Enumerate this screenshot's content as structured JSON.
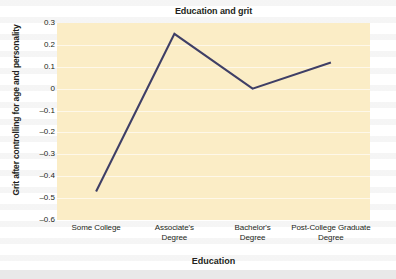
{
  "chart_data": {
    "type": "line",
    "title": "Education and grit",
    "xlabel": "Education",
    "ylabel": "Grit after controlling for age and personality",
    "categories": [
      "Some College",
      "Associate's\nDegree",
      "Bachelor's\nDegree",
      "Post-College Graduate\nDegree"
    ],
    "category_lines": [
      [
        "Some College"
      ],
      [
        "Associate's",
        "Degree"
      ],
      [
        "Bachelor's",
        "Degree"
      ],
      [
        "Post-College Graduate",
        "Degree"
      ]
    ],
    "values": [
      -0.47,
      0.25,
      0.0,
      0.12
    ],
    "series": [
      {
        "name": "Grit",
        "values": [
          -0.47,
          0.25,
          0.0,
          0.12
        ]
      }
    ],
    "ylim": [
      -0.6,
      0.3
    ],
    "ytick_labels": [
      "0.3",
      "0.2",
      "0.1",
      "0",
      "–0.1",
      "–0.2",
      "–0.3",
      "–0.4",
      "–0.5",
      "–0.6"
    ],
    "ytick_values": [
      0.3,
      0.2,
      0.1,
      0.0,
      -0.1,
      -0.2,
      -0.3,
      -0.4,
      -0.5,
      -0.6
    ],
    "grid": true,
    "legend": false,
    "colors": {
      "plot_background": "#fbedc6",
      "line": "#3f3f66",
      "text": "#231f20",
      "gridline": "#ffffff",
      "page_background": "#ffffff"
    }
  }
}
